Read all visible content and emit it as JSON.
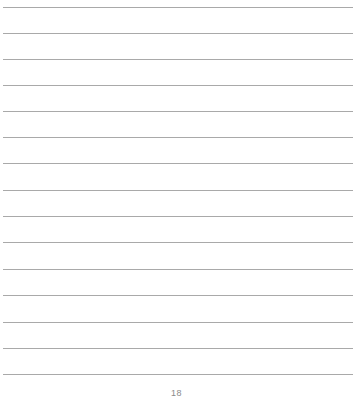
{
  "document": {
    "type": "lined-notebook-page",
    "rule_color": "#a9a9a9",
    "rule_count": 15,
    "rules_y": [
      7,
      33,
      59,
      85,
      111,
      137,
      163,
      190,
      216,
      242,
      269,
      295,
      322,
      348,
      374
    ],
    "page_number": "18"
  }
}
